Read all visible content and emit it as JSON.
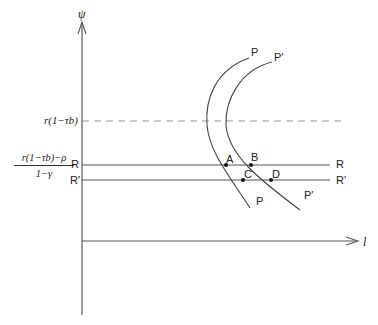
{
  "diagram": {
    "axes": {
      "y_label": "ψ",
      "x_label": "l"
    },
    "levels": {
      "dashed_label": "r(1−τb)",
      "fraction_numerator": "r(1−τb)−ρ",
      "fraction_denominator": "1−γ",
      "R_left": "R",
      "R_right": "R",
      "Rp_left": "R′",
      "Rp_right": "R′"
    },
    "curves": {
      "P_top": "P",
      "P_bottom": "P",
      "Pp_top": "P′",
      "Pp_bottom": "P′"
    },
    "points": {
      "A": "A",
      "B": "B",
      "C": "C",
      "D": "D"
    },
    "colors": {
      "line": "#444444",
      "dashed": "#999999"
    }
  }
}
